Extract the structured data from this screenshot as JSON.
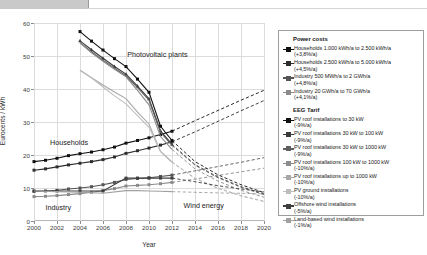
{
  "chart_data": {
    "type": "line",
    "title": "",
    "xlabel": "Year",
    "ylabel": "Eurocents / kWh",
    "xlim": [
      2000,
      2020
    ],
    "ylim": [
      0,
      60
    ],
    "xticks": [
      2000,
      2002,
      2004,
      2006,
      2008,
      2010,
      2012,
      2014,
      2016,
      2018,
      2020
    ],
    "yticks": [
      0,
      10,
      20,
      30,
      40,
      50,
      60
    ],
    "grid": true,
    "legend_position": "right",
    "annotations": [
      {
        "text": "Photovoltaic plants",
        "x": 2008.1,
        "y": 50.5
      },
      {
        "text": "Households",
        "x": 2001.4,
        "y": 24.0
      },
      {
        "text": "Industry",
        "x": 2001.0,
        "y": 4.2
      },
      {
        "text": "Wind energy",
        "x": 2013.0,
        "y": 5.0
      }
    ],
    "series": [
      {
        "name": "Households 1.000 kWh/a to 2.500 kWh/a (+3,8%/a)",
        "group": "Power costs",
        "color": "#111111",
        "style": "solid-then-dashed",
        "marker": "square",
        "x": [
          2000,
          2001,
          2002,
          2003,
          2004,
          2005,
          2006,
          2007,
          2008,
          2009,
          2010,
          2011,
          2012,
          2014,
          2016,
          2018,
          2020
        ],
        "y": [
          18.0,
          18.4,
          19.0,
          19.8,
          20.4,
          20.9,
          21.6,
          22.4,
          23.6,
          24.4,
          25.2,
          26.2,
          27.2,
          30.4,
          33.5,
          36.6,
          39.6
        ]
      },
      {
        "name": "Households 2.500 kWh/a to 5.000 kWh/a (+4,5%/a)",
        "group": "Power costs",
        "color": "#2e2e2e",
        "style": "solid-then-dashed",
        "marker": "square",
        "x": [
          2000,
          2001,
          2002,
          2003,
          2004,
          2005,
          2006,
          2007,
          2008,
          2009,
          2010,
          2011,
          2012,
          2014,
          2016,
          2018,
          2020
        ],
        "y": [
          15.4,
          15.8,
          16.4,
          17.0,
          17.5,
          18.0,
          18.6,
          19.4,
          20.5,
          21.3,
          22.1,
          23.0,
          24.0,
          27.0,
          30.2,
          33.4,
          36.5
        ]
      },
      {
        "name": "Industry 500 MWh/a to 2 GWh/a (+4,8%/a)",
        "group": "Power costs",
        "color": "#555555",
        "style": "solid-then-dashed",
        "marker": "square",
        "x": [
          2000,
          2001,
          2002,
          2003,
          2004,
          2005,
          2006,
          2007,
          2008,
          2009,
          2010,
          2011,
          2012,
          2014,
          2016,
          2018,
          2020
        ],
        "y": [
          9.0,
          9.1,
          9.3,
          9.7,
          10.0,
          10.4,
          11.0,
          11.7,
          12.6,
          12.9,
          13.1,
          13.5,
          13.9,
          15.2,
          16.5,
          17.8,
          19.2
        ]
      },
      {
        "name": "Industry 20 GWh/a to 70 GWh/a (+4,1%/a)",
        "group": "Power costs",
        "color": "#8a8a8a",
        "style": "solid-then-dashed",
        "marker": "square",
        "x": [
          2000,
          2001,
          2002,
          2003,
          2004,
          2005,
          2006,
          2007,
          2008,
          2009,
          2010,
          2011,
          2012,
          2014,
          2016,
          2018,
          2020
        ],
        "y": [
          7.4,
          7.5,
          7.7,
          8.0,
          8.3,
          8.7,
          9.2,
          9.8,
          10.6,
          10.8,
          11.0,
          11.3,
          11.7,
          12.7,
          13.8,
          14.9,
          16.0
        ]
      },
      {
        "name": "PV roof installations to 30 kW (-9%/a)",
        "group": "EEG Tarif",
        "color": "#111111",
        "style": "solid-then-dashed",
        "marker": "square",
        "x": [
          2004,
          2005,
          2006,
          2007,
          2008,
          2009,
          2010,
          2011,
          2012,
          2014,
          2016,
          2018,
          2020
        ],
        "y": [
          57.4,
          54.5,
          51.8,
          49.2,
          46.8,
          43.0,
          39.0,
          28.7,
          24.4,
          18.0,
          14.0,
          11.0,
          8.6
        ]
      },
      {
        "name": "PV roof installations 30 kW to 100 kW (-9%/a)",
        "group": "EEG Tarif",
        "color": "#3a3a3a",
        "style": "solid-then-dashed",
        "marker": "triangle",
        "x": [
          2004,
          2005,
          2006,
          2007,
          2008,
          2009,
          2010,
          2011,
          2012,
          2014,
          2016,
          2018,
          2020
        ],
        "y": [
          54.6,
          51.9,
          49.3,
          46.8,
          44.5,
          40.9,
          37.0,
          27.3,
          23.2,
          17.1,
          13.3,
          10.4,
          8.2
        ]
      },
      {
        "name": "PV roof installations 30 kW to 1000 kW (-9%/a)",
        "group": "EEG Tarif",
        "color": "#5f5f5f",
        "style": "solid-then-dashed",
        "marker": "none",
        "x": [
          2004,
          2005,
          2006,
          2007,
          2008,
          2009,
          2010,
          2011,
          2012,
          2014,
          2016,
          2018,
          2020
        ],
        "y": [
          54.0,
          51.3,
          48.7,
          46.3,
          44.0,
          40.4,
          36.6,
          26.9,
          22.9,
          16.9,
          13.1,
          10.2,
          8.0
        ]
      },
      {
        "name": "PV roof installations 100 kW to 1000 kW (-10%/a)",
        "group": "EEG Tarif",
        "color": "#8c8c8c",
        "style": "solid-then-dashed",
        "marker": "none",
        "x": [
          2004,
          2005,
          2006,
          2007,
          2008,
          2009,
          2010,
          2011,
          2012,
          2014,
          2016,
          2018,
          2020
        ],
        "y": [
          54.0,
          51.0,
          48.4,
          46.0,
          43.7,
          39.6,
          35.2,
          25.6,
          21.7,
          15.8,
          12.1,
          9.3,
          7.2
        ]
      },
      {
        "name": "PV roof installations up to 1000 kW (-10%/a)",
        "group": "EEG Tarif",
        "color": "#a8a8a8",
        "style": "solid-then-dashed",
        "marker": "none",
        "x": [
          2004,
          2005,
          2006,
          2007,
          2008,
          2009,
          2010,
          2011,
          2012,
          2014,
          2016,
          2018,
          2020
        ],
        "y": [
          45.7,
          43.4,
          41.2,
          39.1,
          37.1,
          33.0,
          29.4,
          21.1,
          17.8,
          12.9,
          9.9,
          7.6,
          5.9
        ]
      },
      {
        "name": "PV ground installations (-10%/a)",
        "group": "EEG Tarif",
        "color": "#bdbdbd",
        "style": "solid-then-dashed",
        "marker": "none",
        "x": [
          2004,
          2005,
          2006,
          2007,
          2008,
          2009,
          2010,
          2011,
          2012,
          2014,
          2016,
          2018,
          2020
        ],
        "y": [
          45.7,
          43.4,
          40.6,
          37.9,
          35.5,
          31.9,
          28.4,
          21.1,
          17.9,
          13.0,
          10.0,
          7.7,
          6.0
        ]
      },
      {
        "name": "Offshore wind installations (-5%/a)",
        "group": "EEG Tarif",
        "color": "#3f3f3f",
        "style": "solid-then-dashed",
        "marker": "square",
        "x": [
          2000,
          2002,
          2004,
          2006,
          2008,
          2009,
          2010,
          2011,
          2012,
          2014,
          2016,
          2018,
          2020
        ],
        "y": [
          9.1,
          9.1,
          9.1,
          9.1,
          13.0,
          13.0,
          13.0,
          13.0,
          13.0,
          11.9,
          10.7,
          9.7,
          8.8
        ]
      },
      {
        "name": "Land-based wind installations (-1%/a)",
        "group": "EEG Tarif",
        "color": "#a0a0a0",
        "style": "solid-then-dashed",
        "marker": "none",
        "x": [
          2000,
          2002,
          2004,
          2006,
          2008,
          2009,
          2010,
          2011,
          2012,
          2014,
          2016,
          2018,
          2020
        ],
        "y": [
          9.1,
          8.9,
          8.7,
          8.4,
          9.2,
          9.2,
          9.1,
          9.0,
          8.9,
          8.7,
          8.5,
          8.4,
          8.2
        ]
      }
    ]
  },
  "legend": {
    "group1_title": "Power costs",
    "group2_title": "EEG Tarif",
    "items": [
      {
        "label": "Households 1.000 kWh/a to 2.500 kWh/a",
        "sub": "(+3,8%/a)",
        "color": "#111111",
        "marker": "square"
      },
      {
        "label": "Households 2.500 kWh/a to 5.000 kWh/a",
        "sub": "(+4,5%/a)",
        "color": "#2e2e2e",
        "marker": "square"
      },
      {
        "label": "Industry 500 MWh/a to 2 GWh/a",
        "sub": "(+4,8%/a)",
        "color": "#555555",
        "marker": "square"
      },
      {
        "label": "Industry 20 GWh/a to 70 GWh/a",
        "sub": "(+4,1%/a)",
        "color": "#8a8a8a",
        "marker": "square"
      }
    ],
    "items2": [
      {
        "label": "PV roof installations to 30 kW",
        "sub": "(-9%/a)",
        "color": "#111111",
        "marker": "square"
      },
      {
        "label": "PV roof installations 30 kW to 100 kW",
        "sub": "(-9%/a)",
        "color": "#3a3a3a",
        "marker": "square"
      },
      {
        "label": "PV roof installations 30 kW to 1000 kW",
        "sub": "(-9%/a)",
        "color": "#5f5f5f",
        "marker": "square"
      },
      {
        "label": "PV roof installations 100 kW to 1000 kW",
        "sub": "(-10%/a)",
        "color": "#8c8c8c",
        "marker": "square"
      },
      {
        "label": "PV roof installations up to 1000 kW",
        "sub": "(-10%/a)",
        "color": "#a8a8a8",
        "marker": "square"
      },
      {
        "label": "PV ground installations",
        "sub": "(-10%/a)",
        "color": "#bdbdbd",
        "marker": "square"
      },
      {
        "label": "Offshore wind installations",
        "sub": "(-5%/a)",
        "color": "#3f3f3f",
        "marker": "square"
      },
      {
        "label": "Land-based wind installations",
        "sub": "(-1%/a)",
        "color": "#a0a0a0",
        "marker": "square"
      }
    ]
  }
}
